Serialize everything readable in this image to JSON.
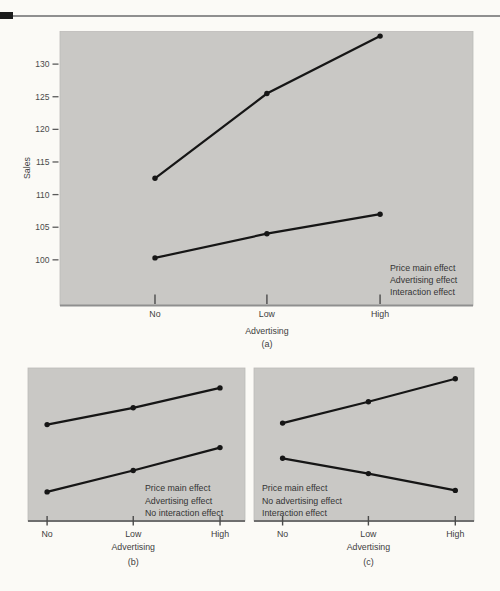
{
  "figure": {
    "description_visible_text_only": "",
    "accent_color": "#1b1b1b",
    "rule_color": "#8f8f8f"
  },
  "chart_data": [
    {
      "id": "a",
      "type": "line",
      "caption": "(a)",
      "xlabel": "Advertising",
      "ylabel": "Sales",
      "categories": [
        "No",
        "Low",
        "High"
      ],
      "yticks": [
        100,
        105,
        110,
        115,
        120,
        125,
        130
      ],
      "ylim": [
        93,
        135
      ],
      "x_fractions": [
        0.23,
        0.501,
        0.775
      ],
      "series": [
        {
          "name": "upper-line",
          "values": [
            112.5,
            125.5,
            134.3
          ]
        },
        {
          "name": "lower-line",
          "values": [
            100.3,
            104,
            107
          ]
        }
      ],
      "annotations": [
        "Price main effect",
        "Advertising effect",
        "Interaction effect"
      ],
      "annotation_side": "bottom-right",
      "grid": false,
      "panel_color": "#c9c8c5",
      "line_color": "#161616"
    },
    {
      "id": "b",
      "type": "line",
      "caption": "(b)",
      "xlabel": "Advertising",
      "ylabel": "",
      "categories": [
        "No",
        "Low",
        "High"
      ],
      "yticks": [],
      "ylim": [
        0,
        100
      ],
      "x_fractions": [
        0.088,
        0.485,
        0.885
      ],
      "series": [
        {
          "name": "upper-line",
          "values": [
            63,
            74,
            87
          ]
        },
        {
          "name": "lower-line",
          "values": [
            19,
            33,
            48
          ]
        }
      ],
      "annotations": [
        "Price main effect",
        "Advertising effect",
        "No interaction effect"
      ],
      "annotation_side": "bottom-right",
      "grid": false,
      "panel_color": "#c9c8c5",
      "line_color": "#161616"
    },
    {
      "id": "c",
      "type": "line",
      "caption": "(c)",
      "xlabel": "Advertising",
      "ylabel": "",
      "categories": [
        "No",
        "Low",
        "High"
      ],
      "yticks": [],
      "ylim": [
        0,
        100
      ],
      "x_fractions": [
        0.13,
        0.52,
        0.915
      ],
      "series": [
        {
          "name": "upper-line",
          "values": [
            64,
            78,
            93
          ]
        },
        {
          "name": "lower-line",
          "values": [
            41,
            31,
            20
          ]
        }
      ],
      "annotations": [
        "Price main effect",
        "No advertising effect",
        "Interaction effect"
      ],
      "annotation_side": "bottom-left",
      "grid": false,
      "panel_color": "#c9c8c5",
      "line_color": "#161616"
    }
  ]
}
